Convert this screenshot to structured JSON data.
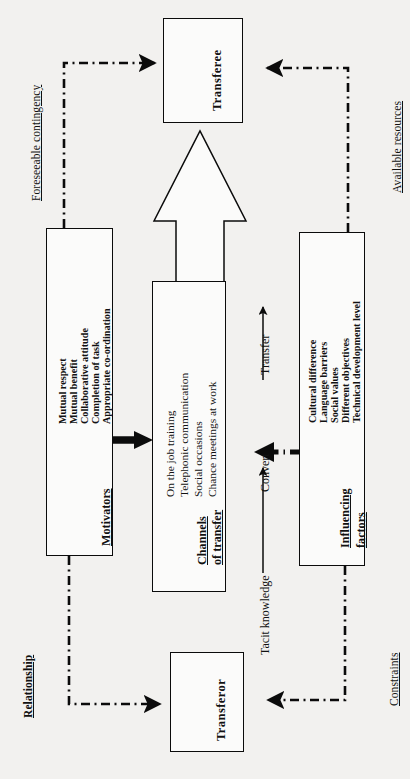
{
  "diagram": {
    "orientation": "rotated-90-ccw",
    "background_color": "#f2f1ef",
    "line_color": "#0b0b0b"
  },
  "nodes": {
    "transferee": {
      "label": "Transferee"
    },
    "transferor": {
      "label": "Transferor"
    },
    "motivators": {
      "title": "Motivators",
      "items": [
        "Mutual respect",
        "Mutual benefit",
        "Collaborative attitude",
        "Completion of task",
        "Appropriate co-ordination"
      ]
    },
    "channels": {
      "title_line1": "Channels",
      "title_line2": "of transfer",
      "items": [
        "On the job training",
        "Telephonic communication",
        "Social occasions",
        "Chance meetings at work"
      ]
    },
    "influencing": {
      "title_line1": "Influencing",
      "title_line2": "factors",
      "items": [
        "Cultural difference",
        "Language barriers",
        "Social values",
        "Different objectives",
        "Technical development level"
      ]
    }
  },
  "edge_labels": {
    "top_left": "Foreseeable contingency",
    "top_right": "Available resources",
    "bottom_left": "Relationship",
    "bottom_right": "Constraints"
  },
  "process_labels": {
    "tacit_knowledge": "Tacit knowledge",
    "convert": "Convert",
    "transfer": "Transfer"
  }
}
